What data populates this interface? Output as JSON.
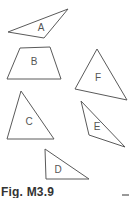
{
  "figure": {
    "caption": "Fig. M3.9",
    "shapes": [
      {
        "label": "A",
        "kind": "triangle",
        "points": "8,32 68,9 44,38",
        "label_pos": [
          41,
          28
        ]
      },
      {
        "label": "B",
        "kind": "trapezoid",
        "points": "20,48 50,47 61,79 7,79",
        "label_pos": [
          34,
          62
        ]
      },
      {
        "label": "F",
        "kind": "triangle",
        "points": "97,49 127,100 75,89",
        "label_pos": [
          98,
          78
        ]
      },
      {
        "label": "C",
        "kind": "triangle",
        "points": "21,91 54,139 7,139",
        "label_pos": [
          29,
          122
        ]
      },
      {
        "label": "E",
        "kind": "triangle",
        "points": "81,101 125,147 89,135",
        "label_pos": [
          97,
          127
        ]
      },
      {
        "label": "D",
        "kind": "triangle",
        "points": "45,149 89,179 46,179",
        "label_pos": [
          58,
          170
        ]
      }
    ]
  }
}
